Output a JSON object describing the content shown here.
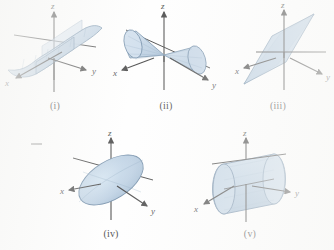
{
  "figure": {
    "background_color": "#fefefe",
    "surface_fill": "#b6cbdf",
    "surface_fill_light": "#cfdeec",
    "surface_edge": "#5c7c9b",
    "axis_color": "#2a2a2a",
    "caption_color": "#262626"
  },
  "axes": {
    "x_label": "x",
    "y_label": "y",
    "z_label": "z"
  },
  "panels": [
    {
      "id": "i",
      "caption": "(i)",
      "shape": "hyperbolic-paraboloid-sheet",
      "description": "Curved saddle-like sheet passing through the origin, elongated along the x-y diagonal"
    },
    {
      "id": "ii",
      "caption": "(ii)",
      "shape": "double-cone",
      "description": "Double circular cone with apex at the origin, axis tilted in the x-y plane"
    },
    {
      "id": "iii",
      "caption": "(iii)",
      "shape": "plane",
      "description": "Tilted plane rendered as a parallelogram through the origin"
    },
    {
      "id": "iv",
      "caption": "(iv)",
      "shape": "elliptical-disk",
      "description": "Tilted circular disk (ellipse in projection) centered at the origin"
    },
    {
      "id": "v",
      "caption": "(v)",
      "shape": "cylinder",
      "description": "Circular cylinder with axis tilted in the x-y plane, centered at the origin"
    }
  ]
}
